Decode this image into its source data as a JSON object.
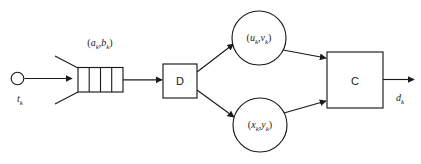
{
  "diagram": {
    "type": "block-flow-diagram",
    "colors": {
      "stroke": "#1a1a1a",
      "fill": "#ffffff",
      "background": "#ffffff"
    },
    "source": {
      "name": "source-node",
      "shape": "circle",
      "label": "t",
      "subscript": "k",
      "label_full": "t_k"
    },
    "queue": {
      "name": "queue-buffer",
      "shape": "rectangle-with-cells",
      "cells": 4,
      "label_open": "(",
      "label_a": "a",
      "label_a_sub": "k",
      "label_comma": ",",
      "label_b": "b",
      "label_b_sub": "k",
      "label_close": ")",
      "label_full": "(a_k, b_k)"
    },
    "blocks": [
      {
        "name": "block-d",
        "shape": "square",
        "label": "D"
      },
      {
        "name": "block-c",
        "shape": "square",
        "label": "C"
      }
    ],
    "circles": [
      {
        "name": "circle-upper",
        "shape": "circle",
        "label_open": "(",
        "label_1": "u",
        "label_1_sub": "k",
        "label_comma": ",",
        "label_2": "v",
        "label_2_sub": "k",
        "label_close": ")",
        "label_full": "(u_k, v_k)"
      },
      {
        "name": "circle-lower",
        "shape": "circle",
        "label_open": "(",
        "label_1": "x",
        "label_1_sub": "k",
        "label_comma": ",",
        "label_2": "y",
        "label_2_sub": "k",
        "label_close": ")",
        "label_full": "(x_k, y_k)"
      }
    ],
    "output": {
      "name": "output-signal",
      "label": "d",
      "subscript": "k",
      "label_full": "d_k"
    }
  }
}
